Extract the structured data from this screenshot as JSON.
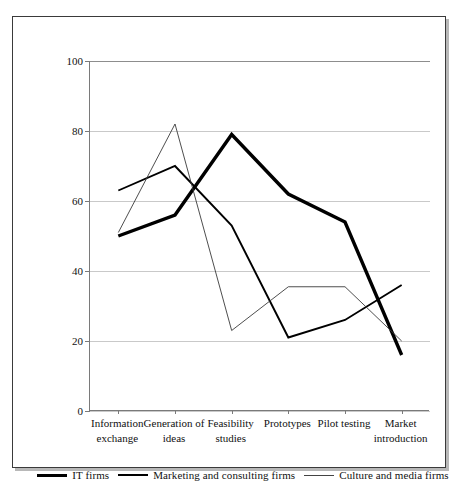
{
  "chart_data": {
    "type": "line",
    "title": "",
    "subtitle": "",
    "xlabel": "",
    "ylabel": "",
    "ylim": [
      0,
      100
    ],
    "yticks": [
      0,
      20,
      40,
      60,
      80,
      100
    ],
    "grid": true,
    "legend_position": "bottom",
    "categories": [
      "Information exchange",
      "Generation of ideas",
      "Feasibility studies",
      "Prototypes",
      "Pilot testing",
      "Market introduction"
    ],
    "category_lines": [
      [
        "Information",
        "exchange"
      ],
      [
        "Generation of",
        "ideas"
      ],
      [
        "Feasibility",
        "studies"
      ],
      [
        "Prototypes",
        ""
      ],
      [
        "Pilot testing",
        ""
      ],
      [
        "Market",
        "introduction"
      ]
    ],
    "series": [
      {
        "name": "IT firms",
        "style": "thick",
        "color": "#000000",
        "width": 3.4,
        "values": [
          50,
          56,
          79,
          62,
          54,
          16
        ]
      },
      {
        "name": "Marketing and consulting firms",
        "style": "medium",
        "color": "#000000",
        "width": 1.9,
        "values": [
          63,
          70,
          53,
          21,
          26,
          36
        ]
      },
      {
        "name": "Culture and media firms",
        "style": "thin",
        "color": "#3a3a3a",
        "width": 0.9,
        "values": [
          51,
          82,
          23,
          35.5,
          35.5,
          20
        ]
      }
    ]
  },
  "axis": {
    "y_tick_labels": [
      "100",
      "80",
      "60",
      "40",
      "20",
      "0"
    ]
  },
  "legend": {
    "items": [
      {
        "label": "IT firms",
        "swatch": "thick-line-swatch"
      },
      {
        "label": "Marketing and consulting firms",
        "swatch": "medium-line-swatch"
      },
      {
        "label": "Culture and media firms",
        "swatch": "thin-line-swatch"
      }
    ]
  }
}
